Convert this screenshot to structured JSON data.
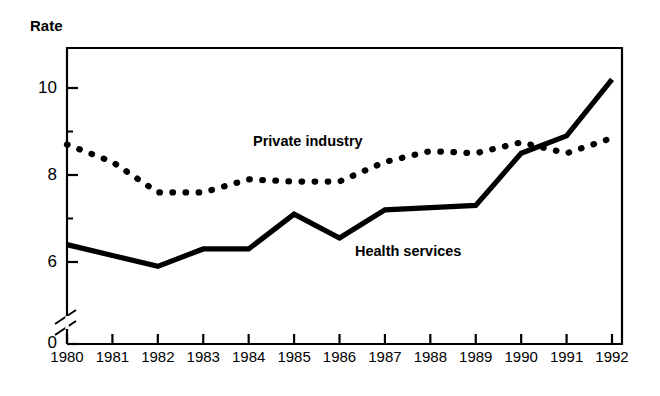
{
  "chart": {
    "axis_title": "Rate",
    "y_tick_labels": [
      "10",
      "8",
      "6",
      "0"
    ],
    "x_tick_labels": [
      "1980",
      "1981",
      "1982",
      "1983",
      "1984",
      "1985",
      "1986",
      "1987",
      "1988",
      "1989",
      "1990",
      "1991",
      "1992"
    ],
    "annotations": {
      "private_industry": "Private industry",
      "health_services": "Health services"
    },
    "colors": {
      "ink": "#000000",
      "background": "#ffffff"
    },
    "axis_break": "//"
  },
  "chart_data": {
    "type": "line",
    "title": "Rate",
    "xlabel": "",
    "ylabel": "Rate",
    "x": [
      1980,
      1981,
      1982,
      1983,
      1984,
      1985,
      1986,
      1987,
      1988,
      1989,
      1990,
      1991,
      1992
    ],
    "categories": [
      "1980",
      "1981",
      "1982",
      "1983",
      "1984",
      "1985",
      "1986",
      "1987",
      "1988",
      "1989",
      "1990",
      "1991",
      "1992"
    ],
    "series": [
      {
        "name": "Private industry",
        "style": "dotted",
        "values": [
          8.7,
          8.3,
          7.6,
          7.6,
          7.9,
          7.85,
          7.85,
          8.3,
          8.55,
          8.5,
          8.75,
          8.5,
          8.85
        ]
      },
      {
        "name": "Health services",
        "style": "solid",
        "values": [
          6.4,
          6.15,
          5.9,
          6.3,
          6.3,
          7.1,
          6.55,
          7.2,
          7.25,
          7.3,
          8.5,
          8.9,
          10.2
        ]
      }
    ],
    "ylim": [
      5.35,
      11.3
    ],
    "y_major_ticks": [
      6,
      8,
      10
    ],
    "y_minor_ticks": [
      7,
      9,
      11
    ],
    "y_axis_has_break": true,
    "y_origin_label": "0",
    "grid": false,
    "legend": "inline-annotations"
  }
}
